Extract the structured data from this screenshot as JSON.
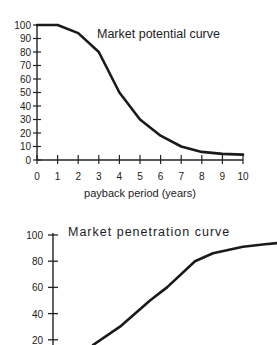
{
  "chart_data": [
    {
      "type": "line",
      "title": "Market potential curve",
      "xlabel": "payback period (years)",
      "ylabel": "",
      "x": [
        0,
        1,
        2,
        3,
        4,
        5,
        6,
        7,
        8,
        9,
        10
      ],
      "series": [
        {
          "name": "Market potential",
          "values": [
            100,
            100,
            94,
            80,
            50,
            30,
            18,
            10,
            6,
            4.5,
            4
          ]
        }
      ],
      "xticks": [
        "0",
        "1",
        "2",
        "3",
        "4",
        "5",
        "6",
        "7",
        "8",
        "9",
        "10"
      ],
      "yticks": [
        "0",
        "10",
        "20",
        "30",
        "40",
        "50",
        "60",
        "70",
        "80",
        "90",
        "100"
      ],
      "xlim": [
        0,
        10
      ],
      "ylim": [
        0,
        100
      ],
      "grid": false,
      "legend": "none"
    },
    {
      "type": "line",
      "title": "Market penetration curve",
      "xlabel": "",
      "ylabel": "",
      "x": [
        0,
        1,
        2,
        3,
        4,
        5,
        6,
        7,
        8
      ],
      "series": [
        {
          "name": "Market penetration",
          "values": [
            16,
            30,
            50,
            60,
            80,
            86,
            91,
            93,
            94
          ]
        }
      ],
      "yticks": [
        "20",
        "40",
        "60",
        "80",
        "100"
      ],
      "ylim": [
        0,
        100
      ],
      "grid": false,
      "legend": "none",
      "note": "Chart is cropped at bottom; x-axis not visible"
    }
  ],
  "charts": {
    "top": {
      "title": "Market potential curve",
      "xlabel": "payback period (years)",
      "xticks": [
        "0",
        "1",
        "2",
        "3",
        "4",
        "5",
        "6",
        "7",
        "8",
        "9",
        "10"
      ],
      "yticks": [
        "0",
        "10",
        "20",
        "30",
        "40",
        "50",
        "60",
        "70",
        "80",
        "90",
        "100"
      ]
    },
    "bottom": {
      "title": "Market penetration curve",
      "yticks": [
        "20",
        "40",
        "60",
        "80",
        "100"
      ]
    }
  }
}
